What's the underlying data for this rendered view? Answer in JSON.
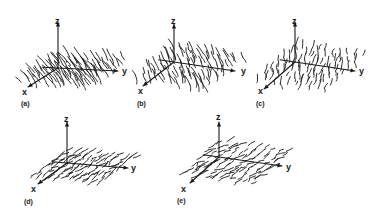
{
  "figure": {
    "panels": [
      {
        "id": "a",
        "caption": "(a)",
        "axes": {
          "z": "z",
          "y": "y",
          "x": "x"
        }
      },
      {
        "id": "b",
        "caption": "(b)",
        "axes": {
          "z": "z",
          "y": "y",
          "x": "x"
        }
      },
      {
        "id": "c",
        "caption": "(c)",
        "axes": {
          "z": "z",
          "y": "y",
          "x": "x"
        }
      },
      {
        "id": "d",
        "caption": "(d)",
        "axes": {
          "z": "z",
          "y": "y",
          "x": "x"
        }
      },
      {
        "id": "e",
        "caption": "(e)",
        "axes": {
          "z": "z",
          "y": "y",
          "x": "x"
        }
      }
    ],
    "colors": {
      "ink": "#1a1a1a",
      "background": "#ffffff"
    }
  }
}
